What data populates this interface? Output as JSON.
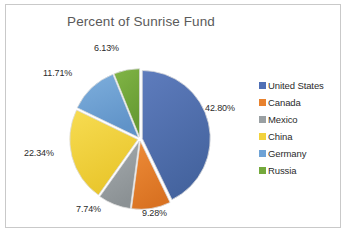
{
  "chart_data": {
    "type": "pie",
    "title": "Percent of Sunrise Fund",
    "xlabel": "",
    "ylabel": "",
    "legend_position": "right",
    "grid": false,
    "exploded": true,
    "start_angle_deg": 0,
    "direction": "clockwise",
    "categories": [
      "United States",
      "Canada",
      "Mexico",
      "China",
      "Germany",
      "Russia"
    ],
    "values": [
      42.8,
      9.28,
      7.74,
      22.34,
      11.71,
      6.13
    ],
    "data_labels": [
      "42.80%",
      "9.28%",
      "7.74%",
      "22.34%",
      "11.71%",
      "6.13%"
    ],
    "colors": [
      "#4f6fb5",
      "#e8822e",
      "#9aa0a3",
      "#f2d23c",
      "#6fa3d6",
      "#74a93c"
    ],
    "total": 100.0,
    "units": "percent"
  },
  "frame": {
    "border_color": "#c9c9c9",
    "background": "#ffffff"
  },
  "title_color": "#5a5a5a"
}
